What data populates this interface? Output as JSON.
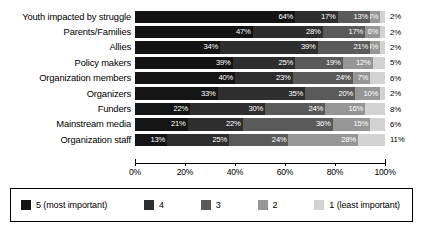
{
  "chart_data": {
    "type": "bar",
    "orientation": "horizontal",
    "stacked": true,
    "normalized_percent": true,
    "title": "",
    "subtitle": "",
    "xlabel": "",
    "ylabel": "",
    "xlim": [
      0,
      100
    ],
    "xticks": [
      "0%",
      "20%",
      "40%",
      "60%",
      "80%",
      "100%"
    ],
    "xtick_values": [
      0,
      20,
      40,
      60,
      80,
      100
    ],
    "grid": false,
    "legend_position": "bottom",
    "categories": [
      "Youth impacted by struggle",
      "Parents/Families",
      "Allies",
      "Policy makers",
      "Organization members",
      "Organizers",
      "Funders",
      "Mainstream media",
      "Organization staff"
    ],
    "series": [
      {
        "name": "5 (most important)",
        "color": "#141414",
        "values": [
          64,
          47,
          34,
          39,
          40,
          33,
          22,
          21,
          13
        ]
      },
      {
        "name": "4",
        "color": "#2e2e2e",
        "values": [
          17,
          28,
          39,
          25,
          23,
          35,
          30,
          22,
          25
        ]
      },
      {
        "name": "3",
        "color": "#5a5a5a",
        "values": [
          13,
          17,
          21,
          19,
          24,
          20,
          24,
          36,
          24
        ]
      },
      {
        "name": "2",
        "color": "#969696",
        "values": [
          4,
          6,
          4,
          12,
          7,
          10,
          16,
          15,
          28
        ]
      },
      {
        "name": "1 (least important)",
        "color": "#d2d2d2",
        "values": [
          2,
          2,
          2,
          5,
          6,
          2,
          8,
          6,
          11
        ]
      }
    ],
    "data_labels": [
      {
        "category": "Youth impacted by struggle",
        "inside": [
          "64%",
          "17%",
          "13%",
          "4%"
        ],
        "outside": "2%"
      },
      {
        "category": "Parents/Families",
        "inside": [
          "47%",
          "28%",
          "17%",
          "6%"
        ],
        "outside": "2%"
      },
      {
        "category": "Allies",
        "inside": [
          "34%",
          "39%",
          "21%",
          "4%"
        ],
        "outside": "2%"
      },
      {
        "category": "Policy makers",
        "inside": [
          "39%",
          "25%",
          "19%",
          "12%"
        ],
        "outside": "5%"
      },
      {
        "category": "Organization members",
        "inside": [
          "40%",
          "23%",
          "24%",
          "7%"
        ],
        "outside": "6%"
      },
      {
        "category": "Organizers",
        "inside": [
          "33%",
          "35%",
          "20%",
          "10%"
        ],
        "outside": "2%"
      },
      {
        "category": "Funders",
        "inside": [
          "22%",
          "30%",
          "24%",
          "16%"
        ],
        "outside": "8%"
      },
      {
        "category": "Mainstream media",
        "inside": [
          "21%",
          "22%",
          "36%",
          "15%"
        ],
        "outside": "6%"
      },
      {
        "category": "Organization staff",
        "inside": [
          "13%",
          "25%",
          "24%",
          "28%"
        ],
        "outside": "11%"
      }
    ]
  },
  "legend": {
    "items": [
      {
        "label": "5 (most important)",
        "key": "s5"
      },
      {
        "label": "4",
        "key": "s4"
      },
      {
        "label": "3",
        "key": "s3"
      },
      {
        "label": "2",
        "key": "s2"
      },
      {
        "label": "1 (least important)",
        "key": "s1"
      }
    ]
  }
}
